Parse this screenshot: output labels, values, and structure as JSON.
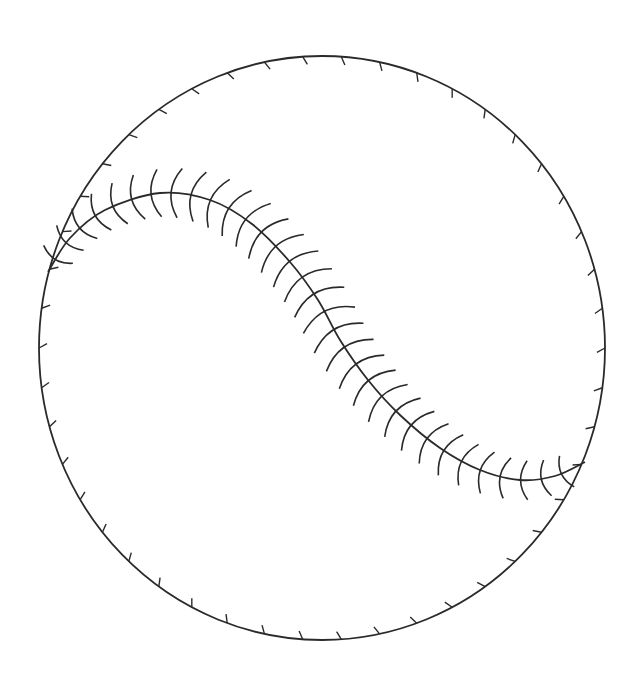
{
  "figure": {
    "stroke_color": "#2a2a2a",
    "background": "#ffffff",
    "ball": {
      "cx": 322,
      "cy": 348,
      "rx": 283,
      "ry": 292
    },
    "seam": {
      "points": [
        [
          48,
          272
        ],
        [
          70,
          238
        ],
        [
          105,
          210
        ],
        [
          160,
          193
        ],
        [
          210,
          200
        ],
        [
          252,
          224
        ],
        [
          290,
          262
        ],
        [
          318,
          300
        ],
        [
          340,
          340
        ],
        [
          368,
          380
        ],
        [
          400,
          415
        ],
        [
          440,
          448
        ],
        [
          480,
          470
        ],
        [
          520,
          480
        ],
        [
          555,
          476
        ],
        [
          585,
          462
        ]
      ],
      "stitch_count": 34,
      "stitch_length": 58
    },
    "rim_ticks": {
      "count": 46,
      "length": 8
    }
  }
}
